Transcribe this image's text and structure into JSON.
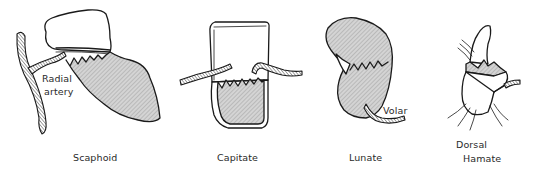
{
  "figure": {
    "panels": [
      {
        "id": "scaphoid",
        "title": "Scaphoid",
        "annotations": [
          "Radial",
          "artery"
        ]
      },
      {
        "id": "capitate",
        "title": "Capitate",
        "annotations": []
      },
      {
        "id": "lunate",
        "title": "Lunate",
        "annotations": [
          "Volar"
        ]
      },
      {
        "id": "hamate",
        "title": "Hamate",
        "annotations": [
          "Dorsal"
        ]
      }
    ],
    "colors": {
      "outline": "#1a1a1a",
      "shaded_region": "#c8c8c8",
      "background": "#ffffff",
      "text": "#2a2a2a"
    }
  }
}
